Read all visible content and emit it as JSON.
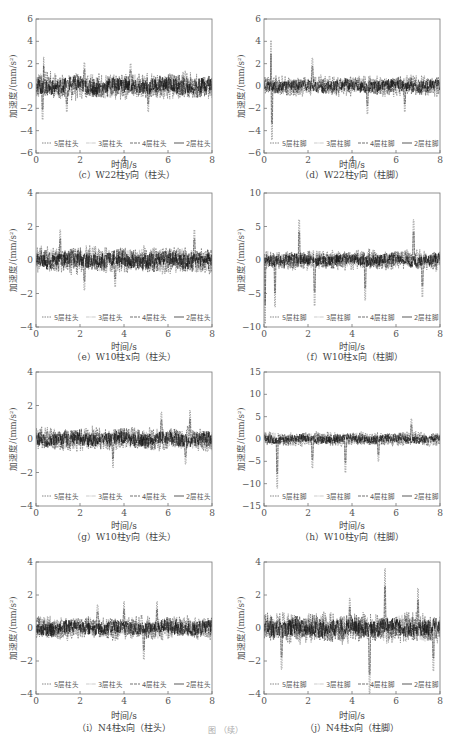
{
  "figure_caption": "图 （续）",
  "chart_data": [
    {
      "id": "c",
      "type": "line",
      "caption": "（c）W22柱y向（柱头）",
      "xlabel": "时间/s",
      "ylabel": "加速度/(mm/s²)",
      "xlim": [
        0,
        8
      ],
      "ylim": [
        -6,
        6
      ],
      "xticks": [
        0,
        2,
        4,
        6,
        8
      ],
      "yticks": [
        -6,
        -4,
        -2,
        0,
        2,
        4,
        6
      ],
      "legend": [
        "5层柱头",
        "3层柱头",
        "4层柱头",
        "2层柱头"
      ],
      "legend_position": "bottom",
      "amp": 1.2,
      "peaks": [
        [
          0.35,
          2.6
        ],
        [
          0.3,
          -3.0
        ],
        [
          2.2,
          2.1
        ],
        [
          4.3,
          2.0
        ],
        [
          5.1,
          -2.3
        ],
        [
          1.4,
          -2.3
        ]
      ]
    },
    {
      "id": "d",
      "type": "line",
      "caption": "（d）W22柱y向（柱脚）",
      "xlabel": "时间/s",
      "ylabel": "加速度/(mm/s²)",
      "xlim": [
        0,
        8
      ],
      "ylim": [
        -6,
        6
      ],
      "xticks": [
        0,
        2,
        4,
        6,
        8
      ],
      "yticks": [
        -6,
        -4,
        -2,
        0,
        2,
        4,
        6
      ],
      "legend": [
        "5层柱脚",
        "3层柱脚",
        "4层柱脚",
        "2层柱脚"
      ],
      "legend_position": "bottom",
      "amp": 0.9,
      "peaks": [
        [
          0.35,
          4.1
        ],
        [
          0.37,
          -4.8
        ],
        [
          2.2,
          2.5
        ],
        [
          4.7,
          2.4
        ],
        [
          4.7,
          -2.5
        ],
        [
          6.4,
          -2.3
        ]
      ]
    },
    {
      "id": "e",
      "type": "line",
      "caption": "（e）W10柱x向（柱头）",
      "xlabel": "时间/s",
      "ylabel": "加速度/(mm/s²)",
      "xlim": [
        0,
        8
      ],
      "ylim": [
        -4,
        4
      ],
      "xticks": [
        0,
        2,
        4,
        6,
        8
      ],
      "yticks": [
        -4,
        -2,
        0,
        2,
        4
      ],
      "legend": [
        "5层柱头",
        "3层柱头",
        "4层柱头",
        "2层柱头"
      ],
      "legend_position": "bottom",
      "amp": 0.8,
      "peaks": [
        [
          1.1,
          1.8
        ],
        [
          2.2,
          -1.8
        ],
        [
          7.2,
          1.8
        ],
        [
          3.6,
          -1.6
        ]
      ]
    },
    {
      "id": "f",
      "type": "line",
      "caption": "（f）W10柱x向（柱脚）",
      "xlabel": "时间/s",
      "ylabel": "加速度/(mm/s²)",
      "xlim": [
        0,
        8
      ],
      "ylim": [
        -10,
        10
      ],
      "xticks": [
        0,
        2,
        4,
        6,
        8
      ],
      "yticks": [
        -10,
        -5,
        0,
        5,
        10
      ],
      "legend": [
        "5层柱脚",
        "3层柱脚",
        "4层柱脚",
        "2层柱脚"
      ],
      "legend_position": "bottom",
      "amp": 1.5,
      "peaks": [
        [
          0.05,
          5.5
        ],
        [
          0.05,
          -9.5
        ],
        [
          0.5,
          -7
        ],
        [
          1.6,
          6
        ],
        [
          2.3,
          -6.8
        ],
        [
          4.6,
          6
        ],
        [
          4.6,
          -6
        ],
        [
          6.8,
          6
        ],
        [
          7.2,
          -5.5
        ]
      ]
    },
    {
      "id": "g",
      "type": "line",
      "caption": "（g）W10柱y向（柱头）",
      "xlabel": "时间/s",
      "ylabel": "加速度/(mm/s²)",
      "xlim": [
        0,
        8
      ],
      "ylim": [
        -4,
        4
      ],
      "xticks": [
        0,
        2,
        4,
        6,
        8
      ],
      "yticks": [
        -4,
        -2,
        0,
        2,
        4
      ],
      "legend": [
        "5层柱头",
        "3层柱头",
        "4层柱头",
        "2层柱头"
      ],
      "legend_position": "bottom",
      "amp": 0.7,
      "peaks": [
        [
          5.7,
          1.6
        ],
        [
          7.0,
          1.7
        ],
        [
          3.5,
          -1.7
        ],
        [
          6.8,
          -1.5
        ]
      ]
    },
    {
      "id": "h",
      "type": "line",
      "caption": "（h）W10柱y向（柱脚）",
      "xlabel": "时间/s",
      "ylabel": "加速度/(mm/s²)",
      "xlim": [
        0,
        8
      ],
      "ylim": [
        -15,
        15
      ],
      "xticks": [
        0,
        2,
        4,
        6,
        8
      ],
      "yticks": [
        -15,
        -10,
        -5,
        0,
        5,
        10,
        15
      ],
      "legend": [
        "5层柱脚",
        "3层柱脚",
        "4层柱脚",
        "2层柱脚"
      ],
      "legend_position": "bottom",
      "amp": 1.6,
      "peaks": [
        [
          0.6,
          13.5
        ],
        [
          0.6,
          -11
        ],
        [
          2.2,
          6.5
        ],
        [
          2.2,
          -6.5
        ],
        [
          3.7,
          6.5
        ],
        [
          3.7,
          -7.5
        ],
        [
          6.7,
          4.5
        ],
        [
          5.2,
          -5
        ]
      ]
    },
    {
      "id": "i",
      "type": "line",
      "caption": "（i）N4柱x向（柱头）",
      "xlabel": "时间/s",
      "ylabel": "加速度/(mm/s²)",
      "xlim": [
        0,
        8
      ],
      "ylim": [
        -4,
        4
      ],
      "xticks": [
        0,
        2,
        4,
        6,
        8
      ],
      "yticks": [
        -4,
        -2,
        0,
        2,
        4
      ],
      "legend": [
        "5层柱头",
        "3层柱头",
        "4层柱头",
        "2层柱头"
      ],
      "legend_position": "bottom",
      "amp": 0.7,
      "peaks": [
        [
          2.8,
          1.4
        ],
        [
          4.0,
          1.6
        ],
        [
          4.9,
          -1.9
        ],
        [
          5.5,
          1.6
        ]
      ]
    },
    {
      "id": "j",
      "type": "line",
      "caption": "（j）N4柱x向（柱脚）",
      "xlabel": "时间/s",
      "ylabel": "加速度/(mm/s²)",
      "xlim": [
        0,
        8
      ],
      "ylim": [
        -4,
        4
      ],
      "xticks": [
        0,
        2,
        4,
        6,
        8
      ],
      "yticks": [
        -4,
        -2,
        0,
        2,
        4
      ],
      "legend": [
        "5层柱脚",
        "3层柱脚",
        "4层柱脚",
        "2层柱脚"
      ],
      "legend_position": "bottom",
      "amp": 0.9,
      "peaks": [
        [
          0.8,
          1.8
        ],
        [
          0.8,
          -2.5
        ],
        [
          4.8,
          4.0
        ],
        [
          4.8,
          -4.0
        ],
        [
          5.5,
          3.6
        ],
        [
          7.7,
          4.0
        ],
        [
          7.7,
          -2.6
        ],
        [
          3.9,
          1.8
        ],
        [
          7.0,
          2.4
        ]
      ]
    }
  ],
  "layout": {
    "positions": [
      {
        "left": 36,
        "top": 19,
        "w": 176,
        "h": 134,
        "cap_top": 168,
        "xl_top": 158
      },
      {
        "left": 264,
        "top": 19,
        "w": 176,
        "h": 134,
        "cap_top": 168,
        "xl_top": 158
      },
      {
        "left": 36,
        "top": 193,
        "w": 176,
        "h": 134,
        "cap_top": 350,
        "xl_top": 340
      },
      {
        "left": 264,
        "top": 193,
        "w": 176,
        "h": 134,
        "cap_top": 350,
        "xl_top": 340
      },
      {
        "left": 36,
        "top": 372,
        "w": 176,
        "h": 134,
        "cap_top": 530,
        "xl_top": 519
      },
      {
        "left": 264,
        "top": 372,
        "w": 176,
        "h": 134,
        "cap_top": 530,
        "xl_top": 519
      },
      {
        "left": 36,
        "top": 562,
        "w": 176,
        "h": 132,
        "cap_top": 721,
        "xl_top": 709
      },
      {
        "left": 264,
        "top": 562,
        "w": 176,
        "h": 132,
        "cap_top": 721,
        "xl_top": 709
      }
    ]
  }
}
